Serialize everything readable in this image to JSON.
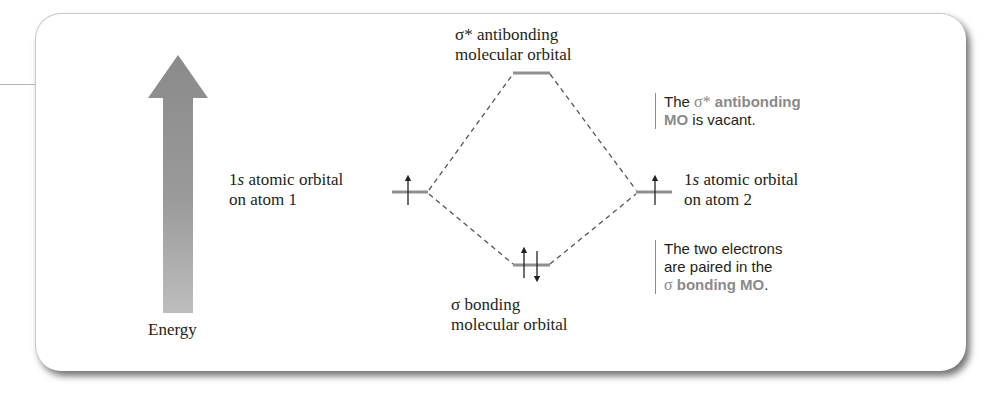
{
  "figure": {
    "type": "molecular-orbital-diagram",
    "axis": {
      "label": "Energy",
      "direction": "up"
    },
    "colors": {
      "orbital_line": "#8f8f8f",
      "arrow_fill_top": "#8a8a8a",
      "arrow_fill_bottom": "#b8b8b8",
      "highlight_text": "#8a8a8a",
      "text": "#231f20"
    },
    "orbitals": {
      "antibonding": {
        "symbol": "σ*",
        "line1_rest": " antibonding",
        "line2": "molecular orbital",
        "electrons": []
      },
      "bonding": {
        "symbol": "σ",
        "line1_rest": " bonding",
        "line2": "molecular orbital",
        "electrons": [
          "up",
          "down"
        ]
      },
      "atom1": {
        "prefix": "1",
        "italic": "s",
        "line1_rest": " atomic orbital",
        "line2": "on atom 1",
        "electrons": [
          "up"
        ]
      },
      "atom2": {
        "prefix": "1",
        "italic": "s",
        "line1_rest": " atomic orbital",
        "line2": "on atom 2",
        "electrons": [
          "up"
        ]
      }
    },
    "notes": {
      "antibonding_note": {
        "pre": "The ",
        "symbol": "σ*",
        "bold1": " antibonding",
        "bold2": "MO",
        "post": " is vacant."
      },
      "bonding_note": {
        "line1": "The two electrons",
        "line2": "are paired in the",
        "symbol": "σ",
        "bold": " bonding MO",
        "post": "."
      }
    }
  }
}
